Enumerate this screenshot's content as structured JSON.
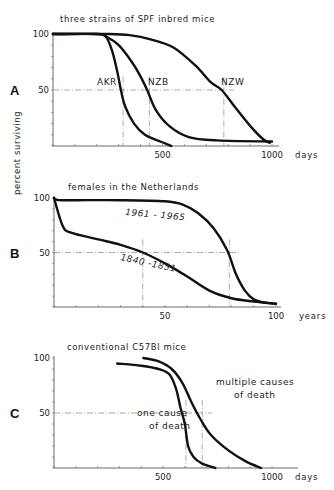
{
  "figure": {
    "ylabel": "percent surviving",
    "line_color": "#111111",
    "guide_color": "#888888"
  },
  "chart_data": [
    {
      "type": "line",
      "panel": "A",
      "title": "three strains of SPF inbred mice",
      "xlabel": "days",
      "ylabel": "percent surviving",
      "xlim": [
        0,
        1000
      ],
      "ylim": [
        0,
        100
      ],
      "xticks": [
        500,
        1000
      ],
      "yticks": [
        50,
        100
      ],
      "grid": false,
      "series": [
        {
          "name": "AKR",
          "x": [
            0,
            200,
            240,
            270,
            295,
            310,
            330,
            370,
            420,
            490,
            540
          ],
          "y": [
            100,
            100,
            98,
            85,
            65,
            50,
            35,
            20,
            10,
            4,
            0
          ]
        },
        {
          "name": "NZB",
          "x": [
            0,
            200,
            240,
            300,
            360,
            400,
            430,
            470,
            530,
            620,
            750,
            1000
          ],
          "y": [
            100,
            100,
            98,
            90,
            75,
            62,
            50,
            32,
            18,
            8,
            5,
            4
          ]
        },
        {
          "name": "NZW",
          "x": [
            0,
            250,
            350,
            450,
            550,
            650,
            720,
            770,
            830,
            900,
            960,
            990
          ],
          "y": [
            100,
            100,
            99,
            95,
            88,
            72,
            57,
            50,
            35,
            18,
            6,
            3
          ]
        }
      ],
      "annotations": [
        {
          "text": "AKR",
          "median_x": 320
        },
        {
          "text": "NZB",
          "median_x": 440
        },
        {
          "text": "NZW",
          "median_x": 780
        }
      ]
    },
    {
      "type": "line",
      "panel": "B",
      "title": "females in the Netherlands",
      "xlabel": "years",
      "ylabel": "percent surviving",
      "xlim": [
        0,
        100
      ],
      "ylim": [
        0,
        100
      ],
      "xticks": [
        50,
        100
      ],
      "yticks": [
        50,
        100
      ],
      "grid": false,
      "series": [
        {
          "name": "1961 - 1965",
          "x": [
            0,
            2,
            10,
            30,
            50,
            58,
            65,
            72,
            78,
            82,
            86,
            90,
            95,
            100
          ],
          "y": [
            100,
            98,
            98,
            98,
            97,
            94,
            86,
            72,
            52,
            30,
            15,
            7,
            4,
            3
          ]
        },
        {
          "name": "1840 -1851",
          "x": [
            0,
            4,
            8,
            20,
            30,
            40,
            50,
            60,
            70,
            80,
            90,
            100
          ],
          "y": [
            100,
            74,
            68,
            62,
            57,
            50,
            40,
            28,
            15,
            8,
            5,
            3
          ]
        }
      ],
      "annotations": [
        {
          "text": "1961 - 1965",
          "median_x": 79
        },
        {
          "text": "1840 -1851",
          "median_x": 40
        }
      ]
    },
    {
      "type": "line",
      "panel": "C",
      "title": "conventional C57Bl mice",
      "xlabel": "days",
      "ylabel": "percent surviving",
      "xlim": [
        0,
        1000
      ],
      "ylim": [
        0,
        100
      ],
      "xticks": [
        500,
        1000
      ],
      "yticks": [
        50,
        100
      ],
      "grid": false,
      "series": [
        {
          "name": "one cause of death",
          "x": [
            290,
            400,
            480,
            530,
            560,
            580,
            600,
            615,
            640,
            680,
            740
          ],
          "y": [
            95,
            93,
            90,
            85,
            72,
            55,
            40,
            20,
            10,
            4,
            0
          ]
        },
        {
          "name": "multiple causes of death",
          "x": [
            410,
            480,
            540,
            590,
            630,
            670,
            720,
            800,
            880,
            950
          ],
          "y": [
            100,
            97,
            90,
            77,
            60,
            45,
            30,
            16,
            6,
            0
          ]
        }
      ],
      "annotations": [
        {
          "text": "one cause",
          "text2": "of death",
          "median_x": 605
        },
        {
          "text": "multiple causes",
          "text2": "of death",
          "median_x": 680
        }
      ]
    }
  ],
  "panels": [
    {
      "letter": "A",
      "title": "three strains of SPF inbred mice",
      "xunit": "days",
      "tick_labels": [
        "100",
        "50",
        "500",
        "1000"
      ]
    },
    {
      "letter": "B",
      "title": "females in the Netherlands",
      "xunit": "years",
      "tick_labels": [
        "100",
        "50",
        "50",
        "100"
      ]
    },
    {
      "letter": "C",
      "title": "conventional C57Bl mice",
      "xunit": "days",
      "tick_labels": [
        "100",
        "50",
        "500",
        "1000"
      ]
    }
  ]
}
